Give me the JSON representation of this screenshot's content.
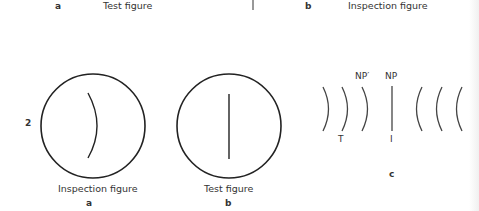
{
  "top_row": {
    "a_letter": "a",
    "a_caption": "Test figure",
    "b_letter": "b",
    "b_caption": "Inspection figure"
  },
  "row_number": "2",
  "panel_a": {
    "caption": "Inspection figure",
    "letter": "a"
  },
  "panel_b": {
    "caption": "Test figure",
    "letter": "b"
  },
  "panel_c": {
    "letter": "c",
    "label_np_prime": "NP′",
    "label_np": "NP",
    "label_t": "T",
    "label_i": "I"
  }
}
